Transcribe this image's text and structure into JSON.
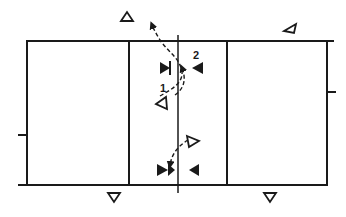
{
  "diagram": {
    "type": "volleyball-court-play-diagram",
    "labels": {
      "move_1": "1",
      "move_2": "2"
    },
    "court": {
      "color": "#1a1a1a",
      "top_line_y": 41,
      "bottom_line_y": 185,
      "left_x": 27,
      "right_x": 327,
      "attack_line_left_x": 129,
      "attack_line_right_x": 227,
      "net_x": 178
    },
    "players": {
      "open_triangles": [
        {
          "id": "top-left-outside",
          "x": 127,
          "y": 17,
          "dir": "up"
        },
        {
          "id": "top-right-outside",
          "x": 289,
          "y": 27,
          "dir": "up-left"
        },
        {
          "id": "upper-mid-left",
          "x": 163,
          "y": 103,
          "dir": "up-left"
        },
        {
          "id": "lower-mid-right",
          "x": 193,
          "y": 141,
          "dir": "right"
        },
        {
          "id": "bottom-left-outside",
          "x": 114,
          "y": 197,
          "dir": "down"
        },
        {
          "id": "bottom-right-outside",
          "x": 270,
          "y": 197,
          "dir": "down"
        }
      ],
      "solid_blockers": [
        {
          "id": "upper-left-blocker",
          "x": 168,
          "y": 68,
          "dir": "right"
        },
        {
          "id": "upper-right-blocker",
          "x": 194,
          "y": 68,
          "dir": "left"
        },
        {
          "id": "lower-left-blocker",
          "x": 164,
          "y": 170,
          "dir": "right"
        },
        {
          "id": "lower-right-blocker",
          "x": 193,
          "y": 170,
          "dir": "left"
        }
      ]
    },
    "movements": [
      {
        "label": "1",
        "description": "dashed curve from mid-left player up over net to top"
      },
      {
        "label": "2",
        "description": "dashed curve toward upper-right blocker"
      },
      {
        "label": "",
        "description": "dashed curve from lower-right open player to lower-left blocker"
      }
    ]
  }
}
